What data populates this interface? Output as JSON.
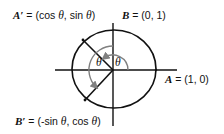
{
  "diagram": {
    "labels": {
      "a_prime": {
        "var": "A′",
        "eq": " = (cos ",
        "theta1": "θ",
        "mid": ", sin ",
        "theta2": "θ",
        "close": ")"
      },
      "b": {
        "var": "B",
        "eq": " = (0, 1)"
      },
      "a": {
        "var": "A",
        "eq": " = (1, 0)"
      },
      "b_prime": {
        "var": "B′",
        "eq": " = (-sin ",
        "theta1": "θ",
        "mid": ", cos ",
        "theta2": "θ",
        "close": ")"
      }
    },
    "angle_labels": {
      "inner": "θ",
      "outer": "θ"
    },
    "colors": {
      "stroke": "#111111",
      "arc": "#808080",
      "background": "#ffffff"
    }
  }
}
